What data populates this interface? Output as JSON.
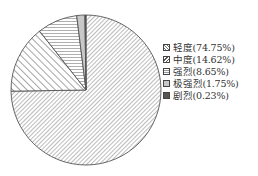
{
  "chart_data": {
    "type": "pie",
    "title": "",
    "categories": [
      "轻度",
      "中度",
      "强烈",
      "极强烈",
      "剧烈"
    ],
    "values": [
      74.75,
      14.62,
      8.65,
      1.75,
      0.23
    ],
    "unit": "%",
    "start_angle": "12 o'clock",
    "direction": "clockwise",
    "legend_position": "right",
    "legend": [
      {
        "label": "轻度(74.75%)",
        "pattern": "fine-diagonal-hatch"
      },
      {
        "label": "中度(14.62%)",
        "pattern": "wide-diagonal-hatch"
      },
      {
        "label": "强烈(8.65%)",
        "pattern": "horizontal-lines"
      },
      {
        "label": "极强烈(1.75%)",
        "pattern": "light-gray"
      },
      {
        "label": "剧烈(0.23%)",
        "pattern": "dark-gray"
      }
    ]
  }
}
